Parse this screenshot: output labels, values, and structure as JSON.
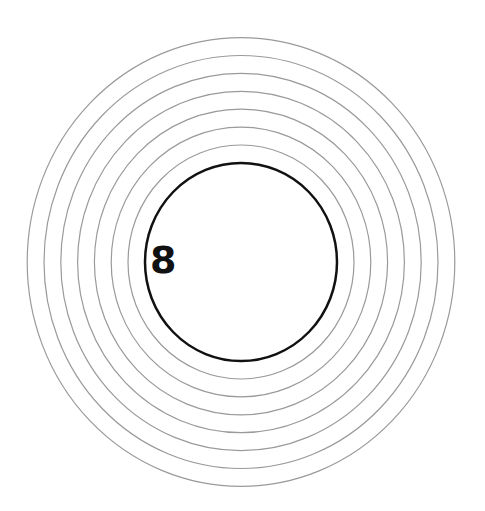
{
  "diagram": {
    "type": "concentric-rings",
    "center": {
      "x": 241,
      "y": 262
    },
    "inner_circle": {
      "rx": 96,
      "ry": 99,
      "stroke": "#111111",
      "stroke_width": 2.5
    },
    "rings": {
      "count": 7,
      "start_rx": 113,
      "start_ry": 117,
      "step_rx": 16.8,
      "step_ry": 17.9,
      "stroke": "#9a9a9a",
      "stroke_width": 1.2
    },
    "label": "8"
  }
}
